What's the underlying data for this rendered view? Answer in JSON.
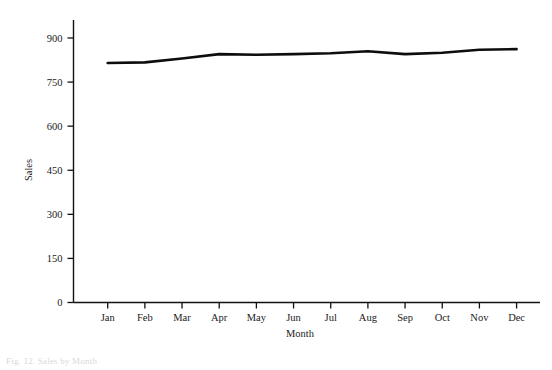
{
  "figure": {
    "caption": "Fig. 12. Sales by Month"
  },
  "chart_data": {
    "type": "line",
    "title": "",
    "xlabel": "Month",
    "ylabel": "Sales",
    "categories": [
      "Jan",
      "Feb",
      "Mar",
      "Apr",
      "May",
      "Jun",
      "Jul",
      "Aug",
      "Sep",
      "Oct",
      "Nov",
      "Dec"
    ],
    "values": [
      815,
      817,
      830,
      845,
      843,
      845,
      848,
      855,
      845,
      850,
      860,
      862
    ],
    "series": [
      {
        "name": "Sales",
        "values": [
          815,
          817,
          830,
          845,
          843,
          845,
          848,
          855,
          845,
          850,
          860,
          862
        ]
      }
    ],
    "xlim": [
      0,
      13
    ],
    "ylim": [
      0,
      975
    ],
    "yticks": [
      0,
      150,
      300,
      450,
      600,
      750,
      900
    ],
    "ytick_labels": [
      "0",
      "150",
      "300",
      "450",
      "600",
      "750",
      "900"
    ],
    "xtick_labels": [
      "Jan",
      "Feb",
      "Mar",
      "Apr",
      "May",
      "Jun",
      "Jul",
      "Aug",
      "Sep",
      "Oct",
      "Nov",
      "Dec"
    ],
    "grid": false,
    "legend": false,
    "legend_position": "none",
    "line_color": "#0d0d0d",
    "background_color": "#ffffff",
    "spines": [
      "left",
      "bottom"
    ]
  }
}
